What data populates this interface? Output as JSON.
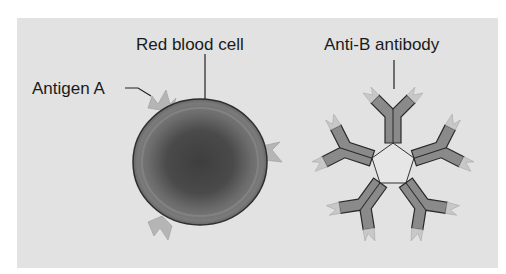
{
  "figure": {
    "background_color": "#e2e2e2",
    "labels": {
      "antigen": "Antigen A",
      "cell": "Red blood cell",
      "antibody": "Anti-B antibody"
    },
    "colors": {
      "cell_fill": "#5a5a5a",
      "antigen_fill": "#b5b5b5",
      "antibody_fill": "#8a8a8a",
      "antibody_tip": "#c8c8c8",
      "outline": "#2a2a2a"
    }
  }
}
